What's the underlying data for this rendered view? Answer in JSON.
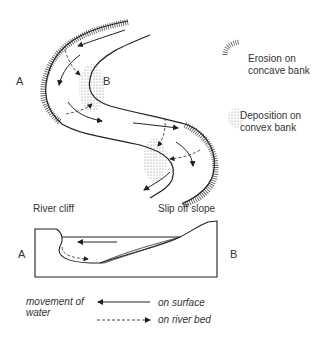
{
  "plan_view": {
    "bank_label_a": "A",
    "bank_label_b": "B"
  },
  "legend_top": {
    "erosion": {
      "line1": "Erosion on",
      "line2": "concave bank",
      "icon": "erosion-hatch-icon"
    },
    "deposition": {
      "line1": "Deposition on",
      "line2": "convex bank",
      "icon": "deposition-stipple-icon"
    }
  },
  "cross_section": {
    "left_label": "River cliff",
    "right_label": "Slip off slope",
    "side_a": "A",
    "side_b": "B"
  },
  "legend_bottom": {
    "title_line1": "movement of",
    "title_line2": "water",
    "surface": "on surface",
    "river_bed": "on river bed"
  }
}
